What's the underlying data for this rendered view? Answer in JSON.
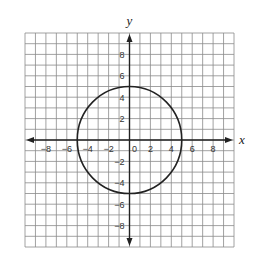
{
  "chart_data": {
    "type": "line",
    "title": "",
    "xlabel": "x",
    "ylabel": "y",
    "xlim": [
      -10,
      10
    ],
    "ylim": [
      -10,
      10
    ],
    "grid": true,
    "grid_step": 1,
    "x_ticks": [
      -8,
      -6,
      -4,
      -2,
      0,
      2,
      4,
      6,
      8
    ],
    "y_ticks": [
      -8,
      -6,
      -4,
      -2,
      2,
      4,
      6,
      8
    ],
    "x_tick_labels": [
      "−8",
      "−6",
      "−4",
      "−2",
      "0",
      "2",
      "4",
      "6",
      "8"
    ],
    "y_tick_labels": [
      "−8",
      "−6",
      "−4",
      "−2",
      "2",
      "4",
      "6",
      "8"
    ],
    "series": [
      {
        "name": "circle",
        "shape": "circle",
        "center": [
          0,
          0
        ],
        "radius": 5,
        "equation": "x^2 + y^2 = 25"
      }
    ],
    "colors": {
      "grid": "#8a8a8a",
      "axis": "#222222",
      "curve": "#222222"
    }
  },
  "labels": {
    "x_axis": "x",
    "y_axis": "y"
  }
}
